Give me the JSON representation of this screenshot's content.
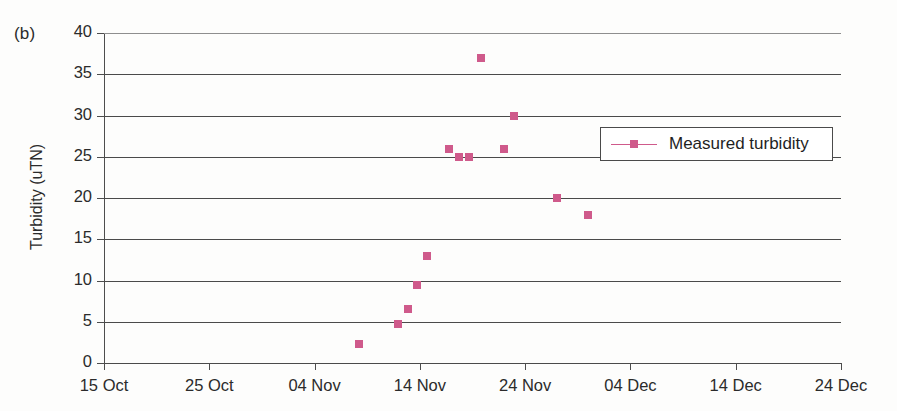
{
  "panel_label": "(b)",
  "chart_data": {
    "type": "scatter",
    "title": "",
    "subtitle": "",
    "xlabel": "",
    "ylabel": "Turbidity (uTN)",
    "grid": true,
    "legend_position": "inside-right",
    "ylim": [
      0,
      40
    ],
    "yticks": [
      0,
      5,
      10,
      15,
      20,
      25,
      30,
      35,
      40
    ],
    "ytick_labels": [
      "0",
      "5",
      "10",
      "15",
      "20",
      "25",
      "30",
      "35",
      "40"
    ],
    "xlim": [
      "15 Oct",
      "24 Dec"
    ],
    "xticks": [
      0,
      10,
      20,
      30,
      40,
      50,
      60,
      70
    ],
    "xtick_labels": [
      "15 Oct",
      "25 Oct",
      "04 Nov",
      "14 Nov",
      "24 Nov",
      "04 Dec",
      "14 Dec",
      "24 Dec"
    ],
    "marker_color": "#cf5a8b",
    "series": [
      {
        "name": "Measured turbidity",
        "marker": "square",
        "color": "#cf5a8b",
        "points": [
          {
            "x": 24.2,
            "x_label": "08 Nov",
            "y": 2.3
          },
          {
            "x": 27.9,
            "x_label": "12 Nov",
            "y": 4.7
          },
          {
            "x": 28.9,
            "x_label": "13 Nov",
            "y": 6.5
          },
          {
            "x": 29.7,
            "x_label": "14 Nov",
            "y": 9.5
          },
          {
            "x": 30.7,
            "x_label": "15 Nov",
            "y": 13.0
          },
          {
            "x": 32.8,
            "x_label": "17 Nov",
            "y": 26.0
          },
          {
            "x": 33.7,
            "x_label": "18 Nov",
            "y": 25.0
          },
          {
            "x": 34.7,
            "x_label": "19 Nov",
            "y": 25.0
          },
          {
            "x": 35.8,
            "x_label": "20 Nov",
            "y": 37.0
          },
          {
            "x": 38.0,
            "x_label": "22 Nov",
            "y": 26.0
          },
          {
            "x": 38.9,
            "x_label": "23 Nov",
            "y": 30.0
          },
          {
            "x": 43.0,
            "x_label": "27 Nov",
            "y": 20.0
          },
          {
            "x": 46.0,
            "x_label": "30 Nov",
            "y": 18.0
          }
        ]
      }
    ]
  },
  "legend": {
    "entries": [
      {
        "label": "Measured turbidity",
        "color": "#cf5a8b",
        "marker": "square"
      }
    ]
  }
}
